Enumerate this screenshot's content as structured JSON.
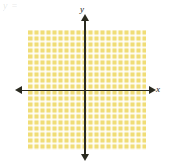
{
  "figure": {
    "width": 170,
    "height": 167,
    "background_color": "#ffffff",
    "caption_remnant": "y = ",
    "type": "coordinate-plane"
  },
  "axes": {
    "x_label": "x",
    "y_label": "y",
    "line_color": "#2a2a20",
    "arrowheads": [
      "left",
      "right",
      "up",
      "down"
    ],
    "origin_x_px": 85,
    "origin_y_px": 90
  },
  "grid": {
    "fill_color": "#f0dd76",
    "line_color": "#ffffff",
    "cell_size_px": 6,
    "columns": 20,
    "rows": 20,
    "left_px": 28,
    "top_px": 30,
    "width_px": 118,
    "height_px": 120
  },
  "chart_data": {
    "type": "scatter",
    "title": "",
    "subtitle": "",
    "xlabel": "x",
    "ylabel": "y",
    "xlim": [
      -9.5,
      10
    ],
    "ylim": [
      -10,
      10
    ],
    "grid": true,
    "grid_step": 1,
    "legend": "none",
    "tick_labels_x": [],
    "tick_labels_y": [],
    "series": [
      {
        "name": "",
        "x": [],
        "y": []
      }
    ],
    "annotations": []
  }
}
